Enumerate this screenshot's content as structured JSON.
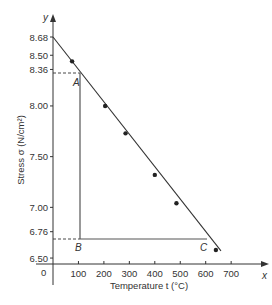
{
  "chart_data": {
    "type": "line",
    "title": "",
    "xlabel": "Temperature t (°C)",
    "ylabel": "Stress σ (N/cm²)",
    "x_axis_letter": "x",
    "y_axis_letter": "y",
    "origin_label": "0",
    "xlim": [
      0,
      750
    ],
    "ylim": [
      6.5,
      8.75
    ],
    "x_ticks": [
      100,
      200,
      300,
      400,
      500,
      600,
      700
    ],
    "y_ticks": [
      "8.68",
      "8.50",
      "8.36",
      "8.00",
      "7.50",
      "7.00",
      "6.76",
      "6.50"
    ],
    "grid": false,
    "series": [
      {
        "name": "measured",
        "x": [
          75,
          205,
          285,
          400,
          485,
          640
        ],
        "y": [
          8.44,
          8.0,
          7.73,
          7.32,
          7.04,
          6.58
        ]
      }
    ],
    "fit_line": {
      "x": [
        0,
        660
      ],
      "y": [
        8.68,
        6.57
      ],
      "equation": "σ = 8.68 - 0.0032 t"
    },
    "annotations": [
      {
        "label": "A",
        "x": 100,
        "y": 8.36
      },
      {
        "label": "B",
        "x": 100,
        "y": 6.76
      },
      {
        "label": "C",
        "x": 600,
        "y": 6.76
      }
    ]
  }
}
